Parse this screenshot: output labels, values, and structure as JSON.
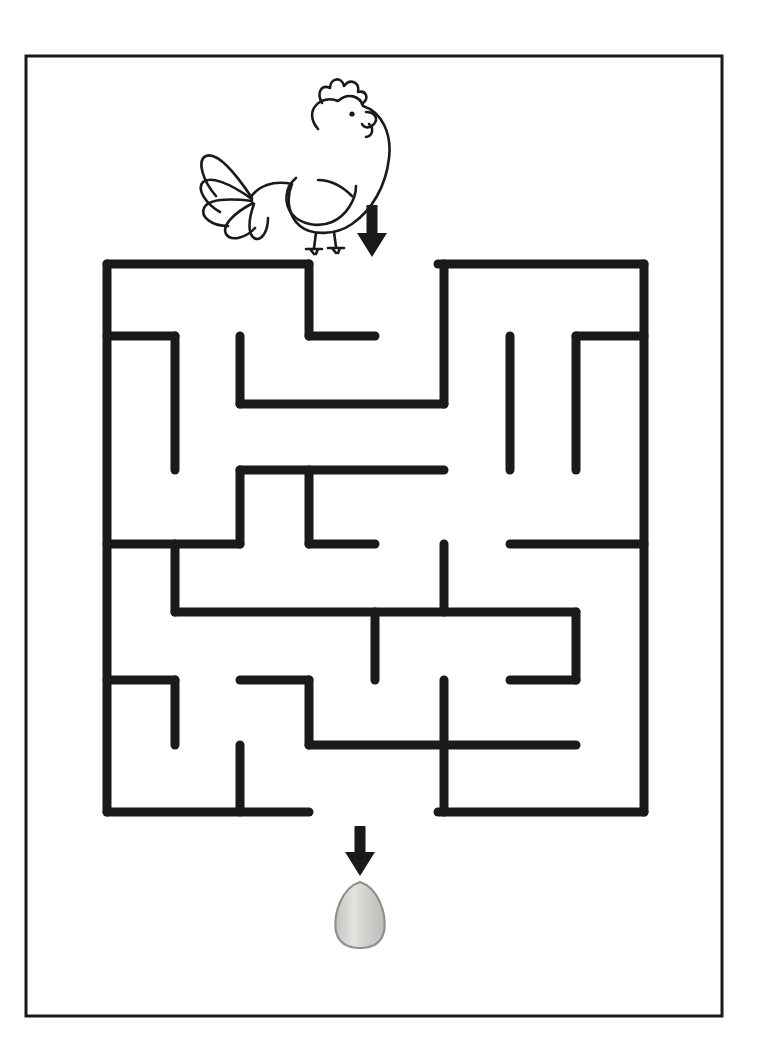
{
  "page": {
    "width": 760,
    "height": 1058,
    "background_color": "#ffffff",
    "border": {
      "x": 26,
      "y": 56,
      "width": 696,
      "height": 960,
      "stroke": "#1a1a1a",
      "stroke_width": 3
    }
  },
  "colors": {
    "ink": "#1a1a1a",
    "maze_wall": "#1a1a1a",
    "egg_fill": "#cfcfcd",
    "egg_shade": "#b3b3b0",
    "egg_highlight": "#e2e2df",
    "egg_outline": "#8f8f8c",
    "paper": "#ffffff"
  },
  "start_figure": {
    "name": "chicken",
    "label": "chicken",
    "x": 196,
    "y": 82,
    "width": 160,
    "height": 170,
    "stroke": "#1a1a1a"
  },
  "arrows": [
    {
      "name": "entrance-arrow",
      "label": "arrow-down",
      "cx": 372,
      "top": 205,
      "bottom": 257,
      "shaft_width": 11,
      "head_width": 30,
      "head_height": 24,
      "color": "#1a1a1a"
    },
    {
      "name": "exit-arrow",
      "label": "arrow-down",
      "cx": 360,
      "top": 826,
      "bottom": 876,
      "shaft_width": 11,
      "head_width": 30,
      "head_height": 24,
      "color": "#1a1a1a"
    }
  ],
  "end_figure": {
    "name": "egg",
    "label": "egg",
    "cx": 360,
    "cy": 915,
    "rx": 26,
    "ry": 33
  },
  "maze": {
    "x": 107,
    "y": 264,
    "width": 537,
    "height": 548,
    "cols": 8,
    "rows": 8,
    "cell_w": 67,
    "cell_h": 68.5,
    "wall_thickness": 9,
    "entrance": {
      "edge": "top",
      "from_x": 309,
      "to_x": 438
    },
    "exit": {
      "edge": "bottom",
      "from_x": 309,
      "to_x": 438
    },
    "walls": [
      {
        "id": "outer-top-left",
        "x1": 107,
        "y1": 264,
        "x2": 309,
        "y2": 264
      },
      {
        "id": "outer-top-right",
        "x1": 438,
        "y1": 264,
        "x2": 644,
        "y2": 264
      },
      {
        "id": "outer-left",
        "x1": 107,
        "y1": 264,
        "x2": 107,
        "y2": 812
      },
      {
        "id": "outer-right",
        "x1": 644,
        "y1": 264,
        "x2": 644,
        "y2": 812
      },
      {
        "id": "outer-bottom-left",
        "x1": 107,
        "y1": 812,
        "x2": 309,
        "y2": 812
      },
      {
        "id": "outer-bottom-right",
        "x1": 438,
        "y1": 812,
        "x2": 644,
        "y2": 812
      },
      {
        "id": "w01",
        "x1": 309,
        "y1": 264,
        "x2": 309,
        "y2": 336
      },
      {
        "id": "w02",
        "x1": 309,
        "y1": 336,
        "x2": 375,
        "y2": 336
      },
      {
        "id": "w03",
        "x1": 107,
        "y1": 336,
        "x2": 175,
        "y2": 336
      },
      {
        "id": "w04",
        "x1": 175,
        "y1": 336,
        "x2": 175,
        "y2": 470
      },
      {
        "id": "w05",
        "x1": 240,
        "y1": 336,
        "x2": 240,
        "y2": 404
      },
      {
        "id": "w06",
        "x1": 240,
        "y1": 404,
        "x2": 444,
        "y2": 404
      },
      {
        "id": "w07",
        "x1": 444,
        "y1": 264,
        "x2": 444,
        "y2": 404
      },
      {
        "id": "w08",
        "x1": 510,
        "y1": 336,
        "x2": 510,
        "y2": 470
      },
      {
        "id": "w09",
        "x1": 576,
        "y1": 336,
        "x2": 644,
        "y2": 336
      },
      {
        "id": "w10",
        "x1": 576,
        "y1": 336,
        "x2": 576,
        "y2": 470
      },
      {
        "id": "w11",
        "x1": 240,
        "y1": 470,
        "x2": 240,
        "y2": 544
      },
      {
        "id": "w12",
        "x1": 240,
        "y1": 470,
        "x2": 444,
        "y2": 470
      },
      {
        "id": "w13",
        "x1": 309,
        "y1": 470,
        "x2": 309,
        "y2": 544
      },
      {
        "id": "w14",
        "x1": 309,
        "y1": 544,
        "x2": 375,
        "y2": 544
      },
      {
        "id": "w15",
        "x1": 107,
        "y1": 544,
        "x2": 240,
        "y2": 544
      },
      {
        "id": "w16",
        "x1": 444,
        "y1": 544,
        "x2": 444,
        "y2": 612
      },
      {
        "id": "w17",
        "x1": 510,
        "y1": 544,
        "x2": 644,
        "y2": 544
      },
      {
        "id": "w18",
        "x1": 175,
        "y1": 544,
        "x2": 175,
        "y2": 612
      },
      {
        "id": "w19",
        "x1": 175,
        "y1": 612,
        "x2": 576,
        "y2": 612
      },
      {
        "id": "w20",
        "x1": 375,
        "y1": 612,
        "x2": 375,
        "y2": 680
      },
      {
        "id": "w21",
        "x1": 576,
        "y1": 612,
        "x2": 576,
        "y2": 680
      },
      {
        "id": "w22",
        "x1": 510,
        "y1": 680,
        "x2": 576,
        "y2": 680
      },
      {
        "id": "w23",
        "x1": 107,
        "y1": 680,
        "x2": 175,
        "y2": 680
      },
      {
        "id": "w24",
        "x1": 175,
        "y1": 680,
        "x2": 175,
        "y2": 745
      },
      {
        "id": "w25",
        "x1": 240,
        "y1": 680,
        "x2": 309,
        "y2": 680
      },
      {
        "id": "w26",
        "x1": 309,
        "y1": 680,
        "x2": 309,
        "y2": 745
      },
      {
        "id": "w27",
        "x1": 309,
        "y1": 745,
        "x2": 576,
        "y2": 745
      },
      {
        "id": "w28",
        "x1": 444,
        "y1": 680,
        "x2": 444,
        "y2": 812
      },
      {
        "id": "w29",
        "x1": 240,
        "y1": 745,
        "x2": 240,
        "y2": 812
      }
    ]
  }
}
